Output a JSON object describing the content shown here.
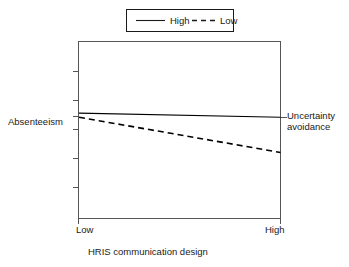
{
  "chart_data": {
    "type": "line",
    "title": "",
    "subtitle": "",
    "xlabel": "HRIS communication design",
    "ylabel": "Absenteeism",
    "y2label": "Uncertainty avoidance",
    "x": [
      "Low",
      "High"
    ],
    "xticklabels": [
      "Low",
      "High"
    ],
    "yticklabels": [],
    "xlim": [
      0,
      1
    ],
    "ylim": [
      0,
      1
    ],
    "grid": false,
    "legend_position": "top-center",
    "series": [
      {
        "name": "High",
        "style": "solid",
        "color": "#000000",
        "values": [
          0.595,
          0.572
        ]
      },
      {
        "name": "Low",
        "style": "dashed",
        "color": "#000000",
        "values": [
          0.572,
          0.373
        ]
      }
    ],
    "annotations": []
  },
  "legend": {
    "entries": [
      {
        "label": "High",
        "style": "solid"
      },
      {
        "label": "Low",
        "style": "dashed"
      }
    ]
  },
  "axes": {
    "left_label": "Absenteeism",
    "right_label_line1": "Uncertainty",
    "right_label_line2": "avoidance",
    "x_tick_low": "Low",
    "x_tick_high": "High",
    "x_title": "HRIS communication design"
  }
}
